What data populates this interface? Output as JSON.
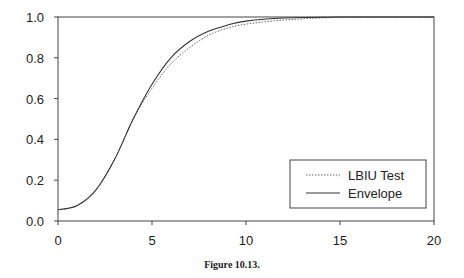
{
  "chart_data": {
    "type": "line",
    "title": "",
    "caption": "Figure 10.13.",
    "xlabel": "",
    "ylabel": "",
    "xlim": [
      0,
      20
    ],
    "ylim": [
      0,
      1.0
    ],
    "xticks": [
      "0",
      "5",
      "10",
      "15",
      "20"
    ],
    "yticks": [
      "0.0",
      "0.2",
      "0.4",
      "0.6",
      "0.8",
      "1.0"
    ],
    "grid": false,
    "legend_position": "lower right",
    "series": [
      {
        "name": "LBIU Test",
        "style": "dotted",
        "x": [
          0,
          1,
          2,
          3,
          4,
          5,
          6,
          7,
          8,
          9,
          10,
          12,
          15,
          20
        ],
        "values": [
          0.055,
          0.075,
          0.15,
          0.3,
          0.5,
          0.65,
          0.77,
          0.85,
          0.91,
          0.945,
          0.965,
          0.985,
          0.998,
          1.0
        ]
      },
      {
        "name": "Envelope",
        "style": "solid",
        "x": [
          0,
          1,
          2,
          3,
          4,
          5,
          6,
          7,
          8,
          9,
          10,
          12,
          15,
          20
        ],
        "values": [
          0.055,
          0.075,
          0.15,
          0.3,
          0.5,
          0.67,
          0.8,
          0.88,
          0.93,
          0.96,
          0.98,
          0.995,
          1.0,
          1.0
        ]
      }
    ]
  }
}
